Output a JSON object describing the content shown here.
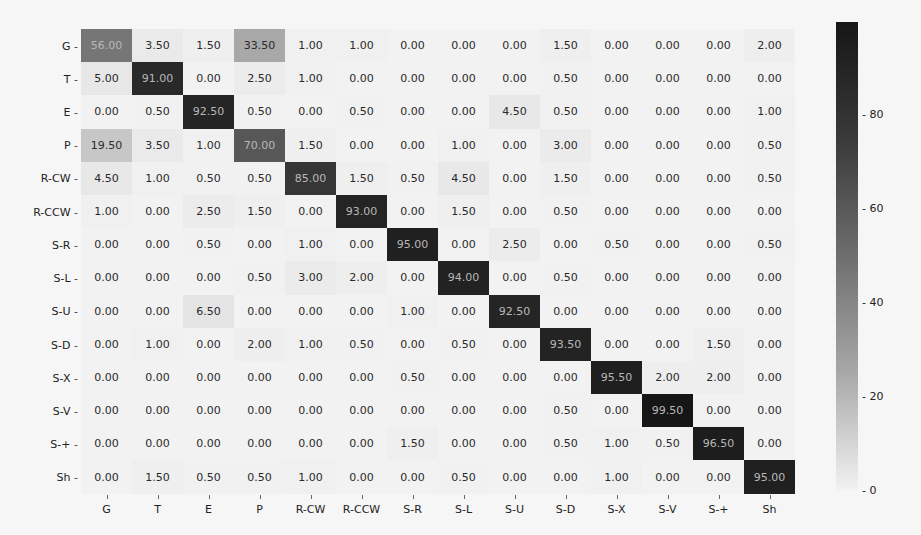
{
  "chart_data": {
    "type": "heatmap",
    "title": "",
    "xlabel": "",
    "ylabel": "",
    "colormap": "Greys",
    "value_range": [
      0,
      99.5
    ],
    "row_labels": [
      "G",
      "T",
      "E",
      "P",
      "R-CW",
      "R-CCW",
      "S-R",
      "S-L",
      "S-U",
      "S-D",
      "S-X",
      "S-V",
      "S-+",
      "Sh"
    ],
    "col_labels": [
      "G",
      "T",
      "E",
      "P",
      "R-CW",
      "R-CCW",
      "S-R",
      "S-L",
      "S-U",
      "S-D",
      "S-X",
      "S-V",
      "S-+",
      "Sh"
    ],
    "values": [
      [
        56.0,
        3.5,
        1.5,
        33.5,
        1.0,
        1.0,
        0.0,
        0.0,
        0.0,
        1.5,
        0.0,
        0.0,
        0.0,
        2.0
      ],
      [
        5.0,
        91.0,
        0.0,
        2.5,
        1.0,
        0.0,
        0.0,
        0.0,
        0.0,
        0.5,
        0.0,
        0.0,
        0.0,
        0.0
      ],
      [
        0.0,
        0.5,
        92.5,
        0.5,
        0.0,
        0.5,
        0.0,
        0.0,
        4.5,
        0.5,
        0.0,
        0.0,
        0.0,
        1.0
      ],
      [
        19.5,
        3.5,
        1.0,
        70.0,
        1.5,
        0.0,
        0.0,
        1.0,
        0.0,
        3.0,
        0.0,
        0.0,
        0.0,
        0.5
      ],
      [
        4.5,
        1.0,
        0.5,
        0.5,
        85.0,
        1.5,
        0.5,
        4.5,
        0.0,
        1.5,
        0.0,
        0.0,
        0.0,
        0.5
      ],
      [
        1.0,
        0.0,
        2.5,
        1.5,
        0.0,
        93.0,
        0.0,
        1.5,
        0.0,
        0.5,
        0.0,
        0.0,
        0.0,
        0.0
      ],
      [
        0.0,
        0.0,
        0.5,
        0.0,
        1.0,
        0.0,
        95.0,
        0.0,
        2.5,
        0.0,
        0.5,
        0.0,
        0.0,
        0.5
      ],
      [
        0.0,
        0.0,
        0.0,
        0.5,
        3.0,
        2.0,
        0.0,
        94.0,
        0.0,
        0.5,
        0.0,
        0.0,
        0.0,
        0.0
      ],
      [
        0.0,
        0.0,
        6.5,
        0.0,
        0.0,
        0.0,
        1.0,
        0.0,
        92.5,
        0.0,
        0.0,
        0.0,
        0.0,
        0.0
      ],
      [
        0.0,
        1.0,
        0.0,
        2.0,
        1.0,
        0.5,
        0.0,
        0.5,
        0.0,
        93.5,
        0.0,
        0.0,
        1.5,
        0.0
      ],
      [
        0.0,
        0.0,
        0.0,
        0.0,
        0.0,
        0.0,
        0.5,
        0.0,
        0.0,
        0.0,
        95.5,
        2.0,
        2.0,
        0.0
      ],
      [
        0.0,
        0.0,
        0.0,
        0.0,
        0.0,
        0.0,
        0.0,
        0.0,
        0.0,
        0.5,
        0.0,
        99.5,
        0.0,
        0.0
      ],
      [
        0.0,
        0.0,
        0.0,
        0.0,
        0.0,
        0.0,
        1.5,
        0.0,
        0.0,
        0.5,
        1.0,
        0.5,
        96.5,
        0.0
      ],
      [
        0.0,
        1.5,
        0.5,
        0.5,
        1.0,
        0.0,
        0.0,
        0.5,
        0.0,
        0.0,
        1.0,
        0.0,
        0.0,
        95.0
      ]
    ],
    "value_format": "2 decimals",
    "colorbar": {
      "ticks": [
        0,
        20,
        40,
        60,
        80
      ],
      "tick_labels": [
        "0",
        "20",
        "40",
        "60",
        "80"
      ],
      "position": "right"
    },
    "grid": false,
    "legend": "colorbar-right"
  }
}
